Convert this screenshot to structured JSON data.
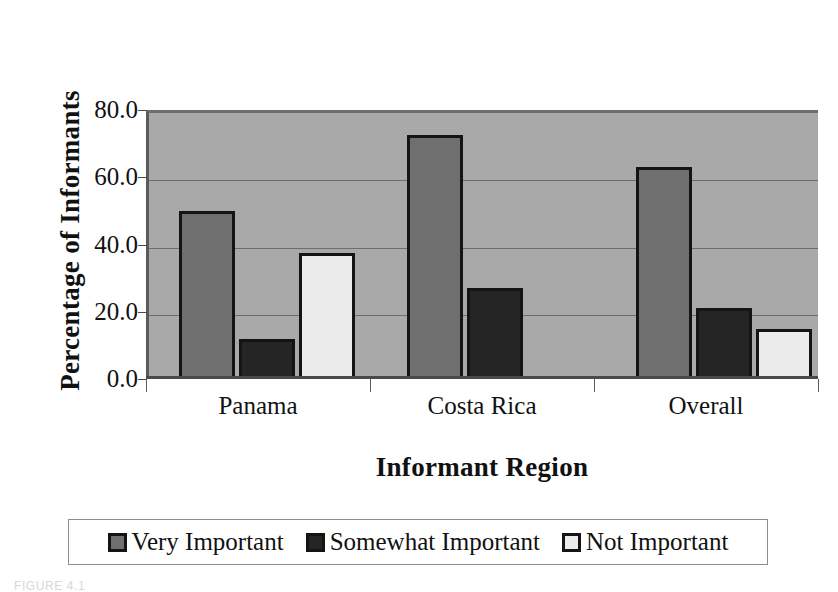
{
  "figure": {
    "caption": "FIGURE 4.1"
  },
  "axes": {
    "ylabel": "Percentage of Informants",
    "xlabel": "Informant Region",
    "yticks": [
      "0.0",
      "20.0",
      "40.0",
      "60.0",
      "80.0"
    ]
  },
  "legend": {
    "items": [
      {
        "label": "Very Important",
        "color": "#6f6f6f"
      },
      {
        "label": "Somewhat Important",
        "color": "#252525"
      },
      {
        "label": "Not Important",
        "color": "#ebebeb"
      }
    ]
  },
  "chart_data": {
    "type": "bar",
    "title": "",
    "xlabel": "Informant Region",
    "ylabel": "Percentage of Informants",
    "ylim": [
      0,
      80
    ],
    "ytick_step": 20,
    "grid": true,
    "legend_position": "bottom",
    "categories": [
      "Panama",
      "Costa Rica",
      "Overall"
    ],
    "series": [
      {
        "name": "Very Important",
        "color": "#6f6f6f",
        "values": [
          50.0,
          72.5,
          63.0
        ]
      },
      {
        "name": "Somewhat Important",
        "color": "#252525",
        "values": [
          12.0,
          27.0,
          21.0
        ]
      },
      {
        "name": "Not Important",
        "color": "#ebebeb",
        "values": [
          37.5,
          null,
          15.0
        ]
      }
    ],
    "plot_background": "#a9a9a9",
    "bar_outline": "#141414"
  }
}
